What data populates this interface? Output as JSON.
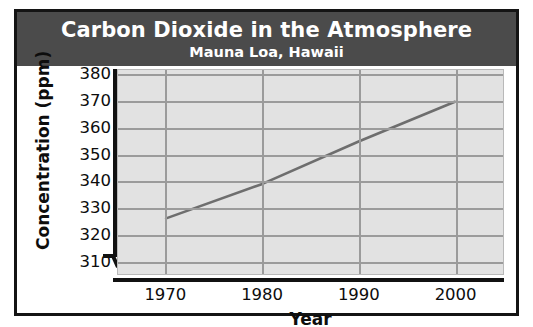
{
  "figure": {
    "title": "Carbon Dioxide in the Atmosphere",
    "subtitle": "Mauna Loa, Hawaii",
    "header_background": "#4b4b4b",
    "header_text_color": "#ffffff",
    "border_color": "#141414"
  },
  "chart_data": {
    "type": "line",
    "title": "Carbon Dioxide in the Atmosphere",
    "subtitle": "Mauna Loa, Hawaii",
    "xlabel": "Year",
    "ylabel": "Concentration (ppm)",
    "x": [
      1970,
      1980,
      1990,
      2000
    ],
    "values": [
      326,
      339,
      355,
      370
    ],
    "series": [
      {
        "name": "CO2 concentration",
        "values": [
          326,
          339,
          355,
          370
        ]
      }
    ],
    "xlim": [
      1965,
      2005
    ],
    "ylim": [
      305,
      382
    ],
    "xticks": [
      1970,
      1980,
      1990,
      2000
    ],
    "yticks": [
      310,
      320,
      330,
      340,
      350,
      360,
      370,
      380
    ],
    "ytick_labels": [
      "310",
      "320",
      "330",
      "340",
      "350",
      "360",
      "370",
      "380"
    ],
    "xtick_labels": [
      "1970",
      "1980",
      "1990",
      "2000"
    ],
    "grid": true,
    "legend": "none",
    "y_axis_break": true,
    "plot_background": "#e2e2e2",
    "grid_color": "#9b9b9b",
    "line_color": "#6e6e6e",
    "axis_color": "#111111"
  }
}
